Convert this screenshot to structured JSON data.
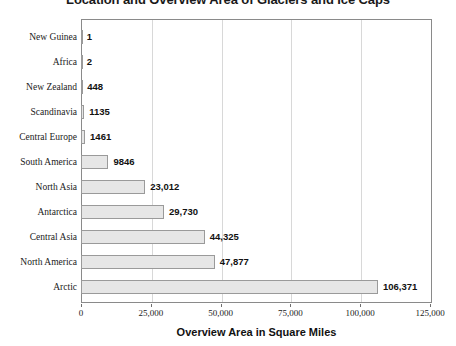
{
  "chart_data": {
    "type": "bar",
    "orientation": "horizontal",
    "title": "Location and Overview Area of Glaciers and Ice Caps",
    "xlabel": "Overview Area in Square Miles",
    "ylabel": "",
    "xlim": [
      0,
      125000
    ],
    "xticks": [
      0,
      25000,
      50000,
      75000,
      100000,
      125000
    ],
    "xtick_labels": [
      "0",
      "25,000",
      "50,000",
      "75,000",
      "100,000",
      "125,000"
    ],
    "grid": true,
    "legend": "none",
    "categories": [
      "New Guinea",
      "Africa",
      "New Zealand",
      "Scandinavia",
      "Central Europe",
      "South America",
      "North Asia",
      "Antarctica",
      "Central Asia",
      "North America",
      "Arctic"
    ],
    "values": [
      1,
      2,
      448,
      1135,
      1461,
      9846,
      23012,
      29730,
      44325,
      47877,
      106371
    ],
    "value_labels": [
      "1",
      "2",
      "448",
      "1135",
      "1461",
      "9846",
      "23,012",
      "29,730",
      "44,325",
      "47,877",
      "106,371"
    ],
    "colors": {
      "bar_fill": "#e6e6e6",
      "bar_border": "#9a9a9a",
      "gridline": "#d8d8d8",
      "frame": "#8a8a8a",
      "text": "#1a1a1a",
      "background": "#ffffff"
    }
  }
}
